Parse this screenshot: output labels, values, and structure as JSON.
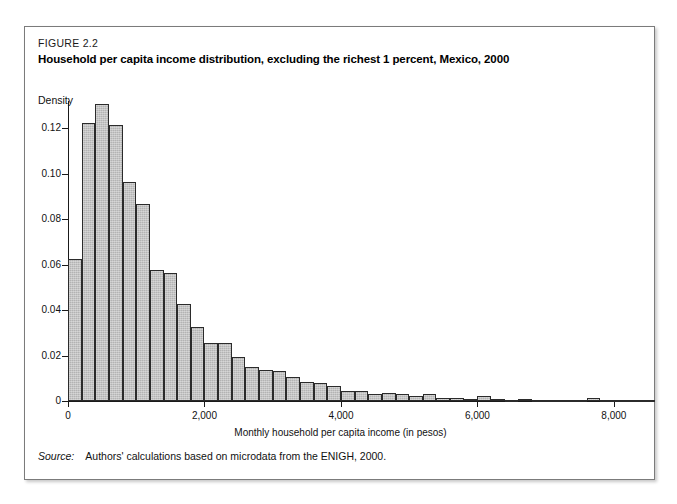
{
  "figure": {
    "number": "FIGURE 2.2",
    "title": "Household per capita income distribution, excluding the richest 1 percent, Mexico, 2000",
    "source_word": "Source:",
    "source_text": "Authors' calculations based on microdata from the ENIGH, 2000."
  },
  "chart_data": {
    "type": "bar",
    "title": "Household per capita income distribution, excluding the richest 1 percent, Mexico, 2000",
    "subtitle": "FIGURE 2.2",
    "xlabel": "Monthly household per capita income (in pesos)",
    "ylabel": "Density",
    "xlim": [
      0,
      8500
    ],
    "ylim": [
      0,
      0.132
    ],
    "grid": false,
    "legend": null,
    "bin_width": 200,
    "xticks": [
      0,
      2000,
      4000,
      6000,
      8000
    ],
    "xtick_labels": [
      "0",
      "2,000",
      "4,000",
      "6,000",
      "8,000"
    ],
    "yticks": [
      0,
      0.02,
      0.04,
      0.06,
      0.08,
      0.1,
      0.12
    ],
    "ytick_labels": [
      "0",
      "0.02",
      "0.04",
      "0.06",
      "0.08",
      "0.10",
      "0.12"
    ],
    "bin_starts": [
      0,
      200,
      400,
      600,
      800,
      1000,
      1200,
      1400,
      1600,
      1800,
      2000,
      2200,
      2400,
      2600,
      2800,
      3000,
      3200,
      3400,
      3600,
      3800,
      4000,
      4200,
      4400,
      4600,
      4800,
      5000,
      5200,
      5400,
      5600,
      5800,
      6000,
      6200,
      6400,
      6600,
      6800,
      7000,
      7200,
      7400,
      7600,
      7800,
      8000,
      8200,
      8400
    ],
    "values": [
      0.0625,
      0.1225,
      0.1305,
      0.1215,
      0.0965,
      0.0865,
      0.0575,
      0.0565,
      0.0425,
      0.0325,
      0.0255,
      0.0255,
      0.0195,
      0.015,
      0.0135,
      0.013,
      0.0105,
      0.0085,
      0.008,
      0.0065,
      0.0045,
      0.0045,
      0.003,
      0.0035,
      0.003,
      0.002,
      0.003,
      0.0015,
      0.0012,
      0.001,
      0.0022,
      0.0008,
      0.0006,
      0.0008,
      0.0005,
      0.0004,
      0.0005,
      0.0004,
      0.0012,
      0.0004,
      0.0003,
      0.0002,
      0.0002
    ],
    "colors": {
      "bar_fill": "#b3b3b3",
      "bar_edge": "#2b2b2b",
      "axis": "#1a1a1a",
      "text": "#111111",
      "frame": "#7b7b7b"
    }
  }
}
